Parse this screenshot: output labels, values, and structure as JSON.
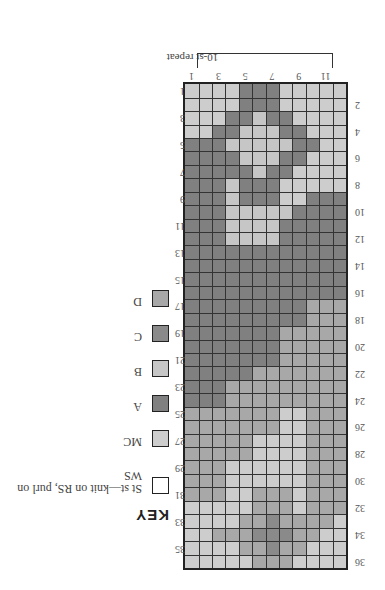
{
  "key": {
    "title": "KEY",
    "items": [
      {
        "code": "st",
        "label": "St st—knit on RS, purl on WS",
        "color": "#ffffff"
      },
      {
        "code": "M",
        "label": "MC",
        "color": "#cdcdcd"
      },
      {
        "code": "A",
        "label": "A",
        "color": "#808080"
      },
      {
        "code": "B",
        "label": "B",
        "color": "#c6c6c6"
      },
      {
        "code": "C",
        "label": "C",
        "color": "#8a8a8a"
      },
      {
        "code": "D",
        "label": "D",
        "color": "#a8a8a8"
      }
    ]
  },
  "chart": {
    "repeat_label": "10-st repeat",
    "columns": 12,
    "rows": 36,
    "col_labels": [
      "1",
      "3",
      "5",
      "7",
      "9",
      "11"
    ],
    "left_row_labels": [
      "1",
      "3",
      "5",
      "7",
      "9",
      "11",
      "13",
      "15",
      "17",
      "19",
      "21",
      "23",
      "25",
      "27",
      "29",
      "31",
      "33",
      "35"
    ],
    "right_row_labels": [
      "2",
      "4",
      "6",
      "8",
      "10",
      "12",
      "14",
      "16",
      "18",
      "20",
      "22",
      "24",
      "26",
      "28",
      "30",
      "32",
      "34",
      "36"
    ],
    "grid_rows_top_to_bottom_as_displayed": [
      "MMMMAAAMMMMM",
      "MMMMAAAMMMMM",
      "MMMAABAAMMMM",
      "MMAABBBAAMMM",
      "AAABBBBBAAMM",
      "AAAABBBAAMMM",
      "AAAAABAAMMMM",
      "AAABAAAMMMMM",
      "AAABAAAMMAAA",
      "AAABBBBBAAAA",
      "AAABBBBAAAAA",
      "AAABBBBAAAAA",
      "AAAAAAAAAAAA",
      "AAAAAAAAAAAA",
      "AAAAAAAAAAAA",
      "AAAAAAAAAAAA",
      "AAAAAAAAADDD",
      "AAAAAAAAADDD",
      "AAAAAAADDDDD",
      "AAAAAAADDDDD",
      "AAAAAAADDDDD",
      "AAAAADDDDDDD",
      "AAADDDDDDDDD",
      "AAADDDDDDDDD",
      "DDDDDDDMMDDD",
      "DDDDDDDMMDDD",
      "DDDDDMMMMDDD",
      "DDDDDMMMMDDD",
      "DDDMMMMMMDDD",
      "DDDMMMMMMDDD",
      "DDDMMDDDMDDD",
      "MMMMMDDDMDDD",
      "MMMMDDCDDDDM",
      "MMDDDCCCDDMM",
      "MMMMDDCDDMMM",
      "MMMMMDDDMMMM"
    ]
  },
  "orientation": "rotated 180 degrees"
}
